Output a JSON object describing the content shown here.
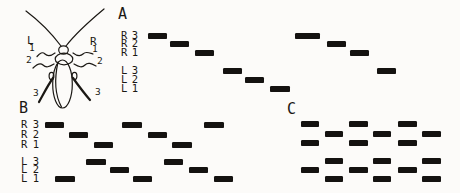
{
  "meta": {
    "background": "#fcfbf9",
    "ink": "#141210",
    "bar_height": 6
  },
  "insect": {
    "side_labels": [
      {
        "text": "L",
        "x": 27,
        "y": 37
      },
      {
        "text": "R",
        "x": 90,
        "y": 38
      }
    ],
    "leg_labels": [
      {
        "text": "1",
        "x": 29,
        "y": 45
      },
      {
        "text": "2",
        "x": 26,
        "y": 57
      },
      {
        "text": "3",
        "x": 33,
        "y": 90
      },
      {
        "text": "1",
        "x": 92,
        "y": 46
      },
      {
        "text": "2",
        "x": 97,
        "y": 58
      },
      {
        "text": "3",
        "x": 95,
        "y": 89
      }
    ]
  },
  "sections": [
    {
      "label": "A",
      "label_x": 118,
      "label_y": 10,
      "show_row_labels": true,
      "labels_x": 121,
      "labels_w": 17,
      "rows": [
        {
          "side": "R",
          "num": "3",
          "y": 33,
          "bars": [
            [
              148,
              19
            ],
            [
              295,
              25
            ]
          ]
        },
        {
          "side": "R",
          "num": "2",
          "y": 41,
          "bars": [
            [
              170,
              19
            ],
            [
              327,
              19
            ]
          ]
        },
        {
          "side": "R",
          "num": "1",
          "y": 50,
          "bars": [
            [
              195,
              19
            ],
            [
              350,
              19
            ]
          ]
        },
        {
          "side": "L",
          "num": "3",
          "y": 68,
          "bars": [
            [
              223,
              19
            ],
            [
              377,
              19
            ]
          ]
        },
        {
          "side": "L",
          "num": "2",
          "y": 77,
          "bars": [
            [
              245,
              19
            ]
          ]
        },
        {
          "side": "L",
          "num": "1",
          "y": 86,
          "bars": [
            [
              270,
              20
            ]
          ]
        }
      ]
    },
    {
      "label": "B",
      "label_x": 19,
      "label_y": 104,
      "show_row_labels": true,
      "labels_x": 21,
      "labels_w": 18,
      "rows": [
        {
          "side": "R",
          "num": "3",
          "y": 122,
          "bars": [
            [
              45,
              19
            ],
            [
              122,
              20
            ],
            [
              204,
              20
            ]
          ]
        },
        {
          "side": "R",
          "num": "2",
          "y": 132,
          "bars": [
            [
              69,
              19
            ],
            [
              148,
              19
            ]
          ]
        },
        {
          "side": "R",
          "num": "1",
          "y": 142,
          "bars": [
            [
              94,
              19
            ],
            [
              172,
              20
            ]
          ]
        },
        {
          "side": "L",
          "num": "3",
          "y": 159,
          "bars": [
            [
              86,
              20
            ],
            [
              164,
              19
            ]
          ]
        },
        {
          "side": "L",
          "num": "2",
          "y": 167,
          "bars": [
            [
              110,
              19
            ],
            [
              189,
              19
            ]
          ]
        },
        {
          "side": "L",
          "num": "1",
          "y": 176,
          "bars": [
            [
              55,
              20
            ],
            [
              133,
              19
            ],
            [
              214,
              19
            ]
          ]
        }
      ]
    },
    {
      "label": "C",
      "label_x": 287,
      "label_y": 105,
      "show_row_labels": false,
      "labels_x": 0,
      "labels_w": 0,
      "rows": [
        {
          "side": "R",
          "num": "3",
          "y": 121,
          "bars": [
            [
              301,
              18
            ],
            [
              349,
              19
            ],
            [
              398,
              19
            ]
          ]
        },
        {
          "side": "R",
          "num": "2",
          "y": 131,
          "bars": [
            [
              325,
              18
            ],
            [
              373,
              18
            ],
            [
              422,
              19
            ]
          ]
        },
        {
          "side": "R",
          "num": "1",
          "y": 140,
          "bars": [
            [
              301,
              18
            ],
            [
              349,
              19
            ],
            [
              398,
              19
            ]
          ]
        },
        {
          "side": "L",
          "num": "3",
          "y": 158,
          "bars": [
            [
              325,
              18
            ],
            [
              373,
              18
            ],
            [
              422,
              19
            ]
          ]
        },
        {
          "side": "L",
          "num": "2",
          "y": 167,
          "bars": [
            [
              301,
              18
            ],
            [
              349,
              19
            ],
            [
              398,
              19
            ]
          ]
        },
        {
          "side": "L",
          "num": "1",
          "y": 176,
          "bars": [
            [
              325,
              18
            ],
            [
              373,
              18
            ],
            [
              422,
              19
            ]
          ]
        }
      ]
    }
  ]
}
